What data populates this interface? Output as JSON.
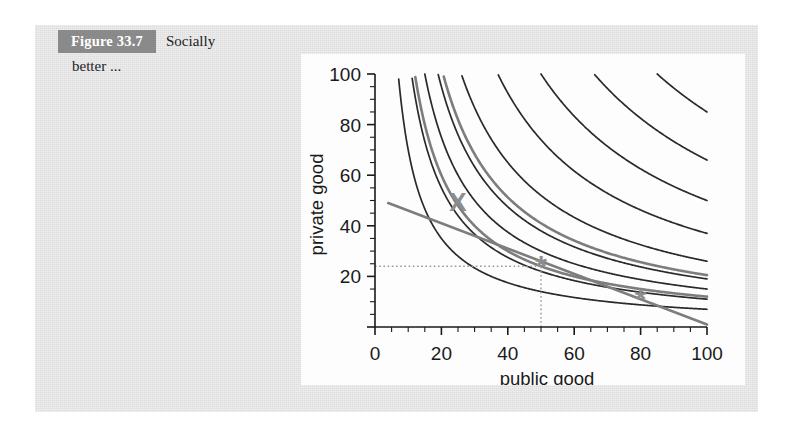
{
  "figure": {
    "number_badge": "Figure 33.7",
    "caption_line1": "Socially",
    "caption_line2": "better ...",
    "badge_bg": "#8a8a8a",
    "page_bg": "#e3e3e3",
    "panel_bg": "#fdfdfd"
  },
  "chart_data": {
    "type": "line",
    "title": "",
    "xlabel": "public good",
    "ylabel": "private good",
    "xlim": [
      0,
      100
    ],
    "ylim": [
      0,
      100
    ],
    "xticks": [
      0,
      20,
      40,
      60,
      80,
      100
    ],
    "yticks": [
      20,
      40,
      60,
      80,
      100
    ],
    "xtick_labels": [
      "0",
      "20",
      "40",
      "60",
      "80",
      "100"
    ],
    "ytick_labels": [
      "20",
      "40",
      "60",
      "80",
      "100"
    ],
    "minor_tick_step": 5,
    "grid": false,
    "legend": "none",
    "curve_color": "#2a2a2a",
    "highlight_color": "#808080",
    "series": [
      {
        "name": "indifference-curve-1",
        "kind": "hyperbola",
        "constant": 700,
        "color": "#2a2a2a",
        "style": "solid"
      },
      {
        "name": "indifference-curve-2",
        "kind": "hyperbola",
        "constant": 1100,
        "color": "#2a2a2a",
        "style": "solid"
      },
      {
        "name": "indifference-curve-3",
        "kind": "hyperbola",
        "constant": 1500,
        "color": "#2a2a2a",
        "style": "solid"
      },
      {
        "name": "indifference-curve-4-pair-dark",
        "kind": "hyperbola",
        "constant": 1900,
        "color": "#2a2a2a",
        "style": "solid"
      },
      {
        "name": "indifference-curve-4-pair-gray",
        "kind": "hyperbola",
        "constant": 2050,
        "color": "#7d7d7d",
        "style": "solid"
      },
      {
        "name": "indifference-curve-5",
        "kind": "hyperbola",
        "constant": 2600,
        "color": "#2a2a2a",
        "style": "solid"
      },
      {
        "name": "indifference-curve-6",
        "kind": "hyperbola",
        "constant": 3700,
        "color": "#2a2a2a",
        "style": "solid"
      },
      {
        "name": "indifference-curve-7",
        "kind": "hyperbola",
        "constant": 5000,
        "color": "#2a2a2a",
        "style": "solid"
      },
      {
        "name": "indifference-curve-8",
        "kind": "hyperbola",
        "constant": 6600,
        "color": "#2a2a2a",
        "style": "solid"
      },
      {
        "name": "indifference-curve-9",
        "kind": "hyperbola",
        "constant": 8500,
        "color": "#2a2a2a",
        "style": "solid"
      },
      {
        "name": "budget-line",
        "kind": "line",
        "from": [
          4,
          49
        ],
        "to": [
          100,
          1
        ],
        "color": "#7d7d7d",
        "style": "solid"
      },
      {
        "name": "tangency-curve-gray",
        "kind": "hyperbola-through",
        "through": [
          50,
          24
        ],
        "color": "#7d7d7d",
        "style": "solid"
      }
    ],
    "markers": [
      {
        "name": "x-marker",
        "glyph": "X",
        "x": 25,
        "y": 49,
        "color": "#8d8d8d",
        "label": ""
      },
      {
        "name": "star-marker-equilibrium",
        "glyph": "*",
        "x": 50,
        "y": 24,
        "color": "#8d8d8d",
        "label": ""
      },
      {
        "name": "star-marker-right",
        "glyph": "*",
        "x": 80,
        "y": 11,
        "color": "#8d8d8d",
        "label": ""
      }
    ],
    "annotations": [
      {
        "name": "dotted-guide-horizontal",
        "kind": "dotted-line",
        "from": [
          0,
          24
        ],
        "to": [
          50,
          24
        ],
        "color": "#9a9a9a"
      },
      {
        "name": "dotted-guide-vertical",
        "kind": "dotted-line",
        "from": [
          50,
          0
        ],
        "to": [
          50,
          24
        ],
        "color": "#9a9a9a"
      }
    ]
  }
}
